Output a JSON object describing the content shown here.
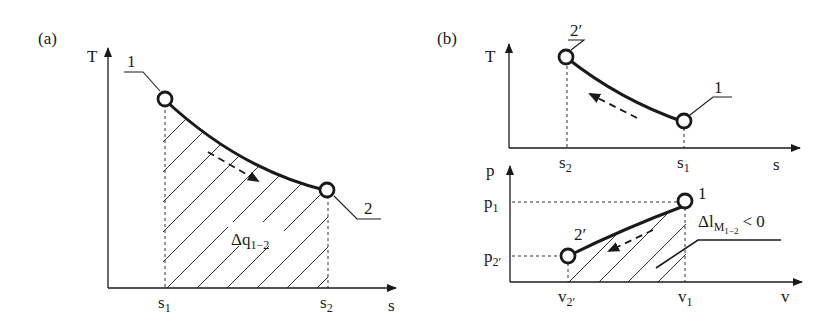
{
  "panel_a": {
    "label": "(a)",
    "y_axis": "T",
    "x_axis": "s",
    "tick_s1": "s",
    "tick_s1_sub": "1",
    "tick_s2": "s",
    "tick_s2_sub": "2",
    "point1": "1",
    "point2": "2",
    "area_label": "Δq",
    "area_label_sub": "1−2"
  },
  "panel_b": {
    "label": "(b)",
    "ts": {
      "y_axis": "T",
      "x_axis": "s",
      "tick_s2": "s",
      "tick_s2_sub": "2",
      "tick_s1": "s",
      "tick_s1_sub": "1",
      "point1": "1",
      "point2": "2′"
    },
    "pv": {
      "y_axis": "p",
      "x_axis": "v",
      "tick_p1": "p",
      "tick_p1_sub": "1",
      "tick_p2": "p",
      "tick_p2_sub": "2′",
      "tick_v2": "v",
      "tick_v2_sub": "2′",
      "tick_v1": "v",
      "tick_v1_sub": "1",
      "point1": "1",
      "point2": "2′",
      "work_label": "Δl",
      "work_label_sub": "M",
      "work_label_subsub": "1−2",
      "work_label_rel": "< 0"
    }
  },
  "colors": {
    "ink": "#1a1a1a",
    "background": "#ffffff"
  }
}
